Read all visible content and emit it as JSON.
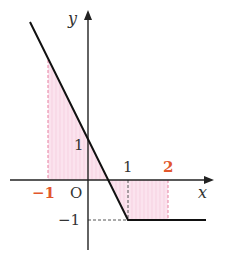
{
  "diagram": {
    "type": "function-graph",
    "axes": {
      "x_label": "x",
      "y_label": "y",
      "origin_label": "O"
    },
    "tick_labels": {
      "x_neg1": "−1",
      "x_1": "1",
      "x_2": "2",
      "y_1": "1",
      "y_neg1": "−1"
    },
    "colors": {
      "axis": "#222222",
      "curve": "#111111",
      "highlight_label": "#e2572c",
      "shade": "#f9dbe8",
      "shade_dash": "#e77f9f",
      "guide_dash": "#444444"
    },
    "function": {
      "pieces": [
        {
          "domain": "x ≤ 1",
          "expression": "y = -2x + 1"
        },
        {
          "domain": "x ≥ 1",
          "expression": "y = -1"
        }
      ],
      "x_intercept": 0.5
    },
    "shaded_regions": [
      {
        "from": -1,
        "to": 0.5,
        "side": "above x-axis"
      },
      {
        "from": 0.5,
        "to": 2,
        "side": "below x-axis"
      }
    ]
  }
}
